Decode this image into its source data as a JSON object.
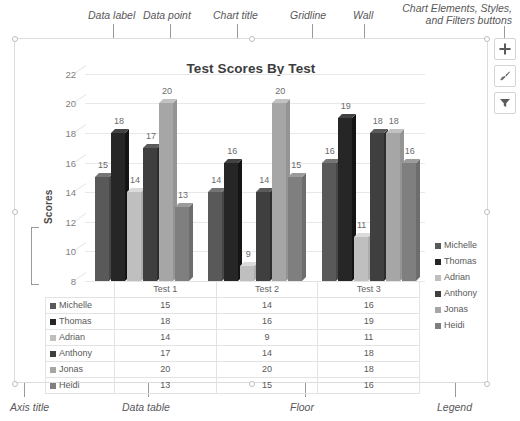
{
  "annotations": {
    "data_label": "Data label",
    "data_point": "Data point",
    "chart_title": "Chart title",
    "gridline": "Gridline",
    "wall": "Wall",
    "buttons": "Chart Elements, Styles, and Filters buttons",
    "axis_title": "Axis title",
    "data_table": "Data table",
    "floor": "Floor",
    "legend": "Legend"
  },
  "side_buttons": [
    {
      "name": "chart-elements-button",
      "icon": "plus-icon"
    },
    {
      "name": "chart-styles-button",
      "icon": "paintbrush-icon"
    },
    {
      "name": "chart-filters-button",
      "icon": "funnel-icon"
    }
  ],
  "chart_data": {
    "type": "bar",
    "title": "Test Scores By Test",
    "xlabel": "",
    "ylabel": "Scores",
    "ylim": [
      8,
      23
    ],
    "yticks": [
      8,
      10,
      12,
      14,
      16,
      18,
      20,
      22
    ],
    "grid": true,
    "legend_position": "right",
    "categories": [
      "Test 1",
      "Test 2",
      "Test 3"
    ],
    "series": [
      {
        "name": "Michelle",
        "color": "#595959",
        "values": [
          15,
          14,
          16
        ]
      },
      {
        "name": "Thomas",
        "color": "#262626",
        "values": [
          18,
          16,
          19
        ]
      },
      {
        "name": "Adrian",
        "color": "#bfbfbf",
        "values": [
          14,
          9,
          11
        ]
      },
      {
        "name": "Anthony",
        "color": "#3f3f3f",
        "values": [
          17,
          14,
          18
        ]
      },
      {
        "name": "Jonas",
        "color": "#a6a6a6",
        "values": [
          20,
          20,
          18
        ]
      },
      {
        "name": "Heidi",
        "color": "#7f7f7f",
        "values": [
          13,
          15,
          16
        ]
      }
    ],
    "data_labels": true
  },
  "table": {
    "corner": "",
    "columns": [
      "Test 1",
      "Test 2",
      "Test 3"
    ],
    "rows": [
      {
        "label": "Michelle",
        "values": [
          "15",
          "14",
          "16"
        ]
      },
      {
        "label": "Thomas",
        "values": [
          "18",
          "16",
          "19"
        ]
      },
      {
        "label": "Adrian",
        "values": [
          "14",
          "9",
          "11"
        ]
      },
      {
        "label": "Anthony",
        "values": [
          "17",
          "14",
          "18"
        ]
      },
      {
        "label": "Jonas",
        "values": [
          "20",
          "20",
          "18"
        ]
      },
      {
        "label": "Heidi",
        "values": [
          "13",
          "15",
          "16"
        ]
      }
    ]
  }
}
